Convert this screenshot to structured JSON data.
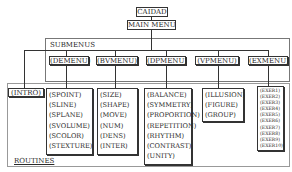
{
  "root": {
    "label": "CAIDAD"
  },
  "main_menu": {
    "label": "MAIN  MENU"
  },
  "submenus_frame": {
    "label": "SUBMENUS"
  },
  "routines_frame": {
    "label": "ROUTINES"
  },
  "intro": {
    "label": "(INTRO)"
  },
  "submenus": [
    {
      "label": "(DEMENU)",
      "routines": [
        "(SPOINT)",
        "(SLINE)",
        "(SPLANE)",
        "(SVOLUME)",
        "(SCOLOR)",
        "(STEXTURE)"
      ]
    },
    {
      "label": "(BVMENU)",
      "routines": [
        "(SIZE)",
        "(SHAPE)",
        "(MOVE)",
        "(NUM)",
        "(DENS)",
        "(INTER)"
      ]
    },
    {
      "label": "(DPMENU)",
      "routines": [
        "(BALANCE)",
        "(SYMMETRY)",
        "(PROPORTION)",
        "(REPETITION)",
        "(RHYTHM)",
        "(CONTRAST)",
        "(UNITY)"
      ]
    },
    {
      "label": "(VPMENU)",
      "routines": [
        "(ILLUSION)",
        "(FIGURE)",
        "(GROUP)"
      ]
    },
    {
      "label": "(EXMENU)",
      "routines": [
        "(EXER1)",
        "(EXER2)",
        "(EXER3)",
        "(EXER4)",
        "(EXER5)",
        "(EXER6)",
        "(EXER7)",
        "(EXER8)",
        "(EXER9)",
        "(EXER10)"
      ]
    }
  ]
}
